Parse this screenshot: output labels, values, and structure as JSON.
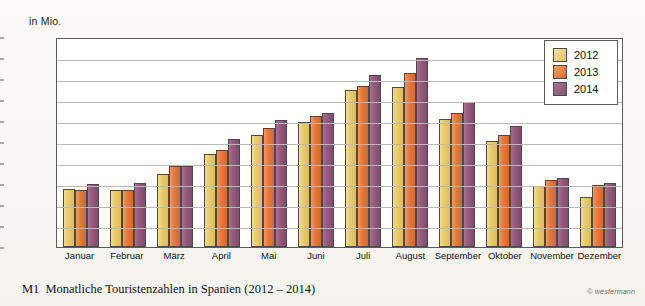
{
  "chart_data": {
    "type": "bar",
    "title": "Monatliche Touristenzahlen in Spanien (2012 – 2014)",
    "figure_ref": "M1",
    "xlabel": "",
    "ylabel": "in Mio.",
    "ylim": [
      0,
      10
    ],
    "yticks": [
      10,
      9,
      8,
      7,
      6,
      5,
      4,
      3,
      2,
      1,
      0
    ],
    "grid": true,
    "legend_position": "top-right",
    "categories": [
      "Januar",
      "Februar",
      "März",
      "April",
      "Mai",
      "Juni",
      "Juli",
      "August",
      "September",
      "Oktober",
      "November",
      "Dezember"
    ],
    "series": [
      {
        "name": "2012",
        "color": "#e3c260",
        "values": [
          2.75,
          2.7,
          3.5,
          4.45,
          5.35,
          5.95,
          7.5,
          7.6,
          6.1,
          5.05,
          2.9,
          2.4
        ]
      },
      {
        "name": "2013",
        "color": "#e8793a",
        "values": [
          2.7,
          2.7,
          3.85,
          4.6,
          5.65,
          6.25,
          7.65,
          8.3,
          6.4,
          5.35,
          3.2,
          2.95
        ]
      },
      {
        "name": "2014",
        "color": "#95597d",
        "values": [
          3.0,
          3.05,
          3.85,
          5.15,
          6.05,
          6.4,
          8.2,
          9.0,
          6.9,
          5.75,
          3.3,
          3.05
        ]
      }
    ]
  },
  "credit": "© westermann"
}
